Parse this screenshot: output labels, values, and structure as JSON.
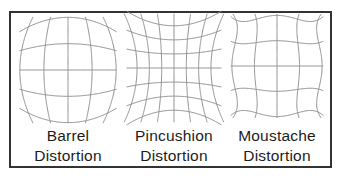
{
  "figure": {
    "background": "#ffffff",
    "border_color": "#333333",
    "grid_line_color": "#8f8f8f",
    "text_color": "#1c1c1c"
  },
  "panels": [
    {
      "id": "barrel",
      "label_line1": "Barrel",
      "label_line2": "Distortion",
      "grid": {
        "type": "barrel",
        "lines": 5,
        "strength": 0.12
      }
    },
    {
      "id": "pincushion",
      "label_line1": "Pincushion",
      "label_line2": "Distortion",
      "grid": {
        "type": "pincushion",
        "lines": 7,
        "strength": 0.12
      }
    },
    {
      "id": "moustache",
      "label_line1": "Moustache",
      "label_line2": "Distortion",
      "grid": {
        "type": "moustache",
        "lines": 5,
        "strength": 0.1
      }
    }
  ]
}
